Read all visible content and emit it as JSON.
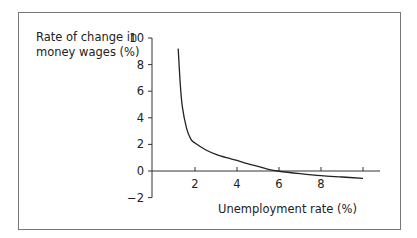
{
  "chart_data": {
    "type": "line",
    "title": "",
    "xlabel": "Unemployment rate (%)",
    "ylabel": "Rate of change in money wages (%)",
    "ylabel_lines": [
      "Rate of change in",
      "money wages (%)"
    ],
    "xlim": [
      0,
      10
    ],
    "ylim": [
      -2,
      10
    ],
    "x_ticks": [
      2,
      4,
      6,
      8,
      10
    ],
    "x_tick_labels": [
      "2",
      "4",
      "6",
      "8",
      ""
    ],
    "y_ticks": [
      -2,
      0,
      2,
      4,
      6,
      8,
      10
    ],
    "y_tick_labels": [
      "−2",
      "0",
      "2",
      "4",
      "6",
      "8",
      "10"
    ],
    "grid": false,
    "legend": null,
    "series": [
      {
        "name": "Phillips curve",
        "x": [
          1.2,
          1.3,
          1.4,
          1.6,
          1.8,
          2.0,
          2.5,
          3.0,
          3.5,
          4.0,
          4.5,
          5.0,
          5.5,
          6.0,
          7.0,
          8.0,
          9.0,
          10.0
        ],
        "y": [
          9.2,
          6.5,
          4.8,
          3.2,
          2.4,
          2.1,
          1.6,
          1.25,
          1.0,
          0.8,
          0.55,
          0.35,
          0.12,
          -0.02,
          -0.2,
          -0.35,
          -0.45,
          -0.55
        ]
      }
    ]
  }
}
